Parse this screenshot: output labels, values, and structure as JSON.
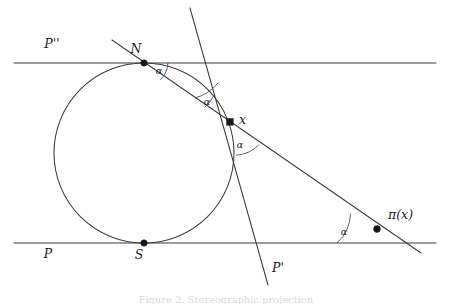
{
  "figure": {
    "type": "geometric-diagram",
    "background_color": "#ffffff",
    "ink_color": "#3d3d43",
    "caption": "Figure 2. Stereographic projection"
  },
  "lines": {
    "top_parallel": {
      "label": "P''",
      "label_x": 52,
      "label_y": 48,
      "x1": 14,
      "y1": 63,
      "x2": 436,
      "y2": 63
    },
    "bottom_parallel": {
      "label": "P",
      "label_x": 48,
      "label_y": 258,
      "x1": 14,
      "y1": 243,
      "x2": 436,
      "y2": 243
    },
    "steep_line": {
      "label": "P'",
      "label_x": 278,
      "label_y": 272,
      "x1": 190,
      "y1": 8,
      "x2": 268,
      "y2": 285
    },
    "secant_line": {
      "label": "",
      "x1": 112,
      "y1": 40,
      "x2": 421,
      "y2": 253
    }
  },
  "circle": {
    "center_x": 144,
    "center_y": 153,
    "radius": 90
  },
  "points": [
    {
      "name": "N",
      "label": "N",
      "x": 144,
      "y": 63,
      "label_x": 136,
      "label_y": 53
    },
    {
      "name": "S",
      "label": "S",
      "x": 144,
      "y": 243,
      "label_x": 139,
      "label_y": 259
    },
    {
      "name": "x",
      "label": "x",
      "x": 230,
      "y": 122,
      "label_x": 239,
      "label_y": 124
    },
    {
      "name": "pi-of-x",
      "label": "π(x)",
      "x": 377,
      "y": 229,
      "label_x": 388,
      "label_y": 219
    }
  ],
  "angles": [
    {
      "name": "alpha-at-N",
      "label": "α",
      "label_x": 159,
      "label_y": 74
    },
    {
      "name": "alpha-upper-at-x",
      "label": "α",
      "label_x": 207,
      "label_y": 105
    },
    {
      "name": "alpha-lower-at-x",
      "label": "α",
      "label_x": 240,
      "label_y": 148
    },
    {
      "name": "alpha-at-pi-x",
      "label": "α",
      "label_x": 344,
      "label_y": 235
    }
  ]
}
